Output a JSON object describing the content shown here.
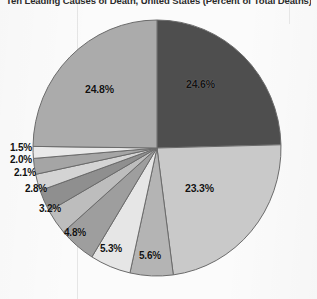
{
  "title": "Ten Leading Causes of Death, United States (Percent of Total Deaths)",
  "background_color": "#fbfbfb",
  "label_color": "#111111",
  "chart_data": {
    "type": "pie",
    "title": "Ten Leading Causes of Death, United States (Percent of Total Deaths)",
    "xlabel": "",
    "ylabel": "",
    "grid": false,
    "legend": "none",
    "start_angle_deg": 0,
    "direction": "clockwise",
    "units": "percent",
    "total": 100.0,
    "categories": [
      "Slice 1",
      "Slice 2",
      "Slice 3",
      "Slice 4",
      "Slice 5",
      "Slice 6",
      "Slice 7",
      "Slice 8",
      "Slice 9",
      "Slice 10",
      "Slice 11"
    ],
    "values": [
      24.6,
      23.3,
      5.6,
      5.3,
      4.8,
      3.2,
      2.8,
      2.1,
      2.0,
      1.5,
      24.8
    ],
    "labels": [
      "24.6%",
      "23.3%",
      "5.6%",
      "5.3%",
      "4.8%",
      "3.2%",
      "2.8%",
      "2.1%",
      "2.0%",
      "1.5%",
      "24.8%"
    ],
    "colors": [
      "#4e4e4e",
      "#c9c9c9",
      "#b4b4b4",
      "#e6e6e6",
      "#9e9e9e",
      "#bdbdbd",
      "#8f8f8f",
      "#d4d4d4",
      "#a5a5a5",
      "#e9e9e9",
      "#ababab"
    ],
    "slice_border_color": "#6b6b6b",
    "label_positions": [
      {
        "label": "24.6%",
        "x": 186,
        "y": 78,
        "inside": true
      },
      {
        "label": "23.3%",
        "x": 185,
        "y": 182,
        "inside": true
      },
      {
        "label": "5.6%",
        "x": 139,
        "y": 250,
        "inside": false
      },
      {
        "label": "5.3%",
        "x": 100,
        "y": 243,
        "inside": false
      },
      {
        "label": "4.8%",
        "x": 64,
        "y": 227,
        "inside": false
      },
      {
        "label": "3.2%",
        "x": 39,
        "y": 203,
        "inside": false
      },
      {
        "label": "2.8%",
        "x": 25,
        "y": 183,
        "inside": false
      },
      {
        "label": "2.1%",
        "x": 14,
        "y": 167,
        "inside": false
      },
      {
        "label": "2.0%",
        "x": 10,
        "y": 154,
        "inside": false
      },
      {
        "label": "1.5%",
        "x": 10,
        "y": 142,
        "inside": false
      },
      {
        "label": "24.8%",
        "x": 85,
        "y": 83,
        "inside": true
      }
    ]
  }
}
